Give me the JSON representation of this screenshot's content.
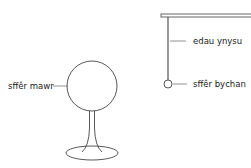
{
  "diagram": {
    "labels": {
      "large_sphere": "sffêr mawr",
      "insulating_thread": "edau ynysu",
      "small_sphere": "sffêr bychan"
    },
    "colors": {
      "stroke": "#444444",
      "leader": "#777777",
      "text": "#222222",
      "background": "#ffffff"
    }
  }
}
